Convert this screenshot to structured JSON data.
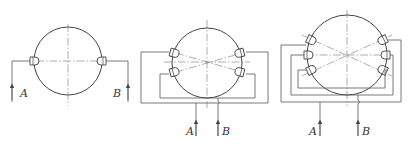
{
  "figure": {
    "colors": {
      "line": "#555555",
      "background": "#ffffff"
    },
    "panels": [
      {
        "id": "two-nozzle",
        "nozzle_count": 2,
        "inlet_a_label": "A",
        "inlet_b_label": "B"
      },
      {
        "id": "four-nozzle",
        "nozzle_count": 4,
        "inlet_a_label": "A",
        "inlet_b_label": "B"
      },
      {
        "id": "six-nozzle",
        "nozzle_count": 6,
        "inlet_a_label": "A",
        "inlet_b_label": "B"
      }
    ]
  }
}
